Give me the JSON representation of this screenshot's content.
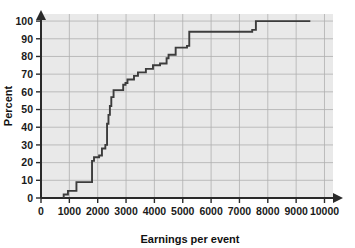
{
  "chart_data": {
    "type": "line",
    "subtype": "step-ecdf",
    "title": "",
    "xlabel": "Earnings per event",
    "ylabel": "Percent",
    "xlim": [
      0,
      10300
    ],
    "ylim": [
      0,
      104
    ],
    "grid": true,
    "legend": null,
    "xticks": [
      0,
      1000,
      2000,
      3000,
      4000,
      5000,
      6000,
      7000,
      8000,
      9000,
      10000
    ],
    "xticklabels": [
      "0",
      "1000",
      "2000",
      "3000",
      "4000",
      "5000",
      "6000",
      "7000",
      "8000",
      "9000",
      "10000"
    ],
    "yticks": [
      0,
      10,
      20,
      30,
      40,
      50,
      60,
      70,
      80,
      90,
      100
    ],
    "yticklabels": [
      "0",
      "10",
      "20",
      "30",
      "40",
      "50",
      "60",
      "70",
      "80",
      "90",
      "100"
    ],
    "x": [
      800,
      800,
      950,
      950,
      1250,
      1250,
      1800,
      1800,
      1870,
      1870,
      2050,
      2050,
      2150,
      2150,
      2270,
      2270,
      2330,
      2330,
      2380,
      2380,
      2430,
      2430,
      2480,
      2480,
      2560,
      2560,
      2900,
      2900,
      2980,
      2980,
      3050,
      3050,
      3280,
      3280,
      3420,
      3420,
      3700,
      3700,
      3950,
      3950,
      4200,
      4200,
      4430,
      4430,
      4500,
      4500,
      4750,
      4750,
      5150,
      5150,
      5230,
      5230,
      7450,
      7450,
      7580,
      7580,
      9500
    ],
    "y": [
      0,
      2,
      2,
      4,
      4,
      9,
      9,
      21,
      21,
      23,
      23,
      24,
      24,
      28,
      28,
      30,
      30,
      42,
      42,
      47,
      47,
      52,
      52,
      57,
      57,
      61,
      61,
      64,
      64,
      65,
      65,
      67,
      67,
      69,
      69,
      71,
      71,
      73,
      73,
      75,
      75,
      76,
      76,
      79,
      79,
      81,
      81,
      85,
      85,
      86,
      86,
      94,
      94,
      95,
      95,
      100,
      100
    ],
    "series": [
      {
        "name": "cumulative percent",
        "color": "#3c3c3c",
        "steps": [
          {
            "x": 800,
            "percent": 2
          },
          {
            "x": 950,
            "percent": 4
          },
          {
            "x": 1250,
            "percent": 9
          },
          {
            "x": 1800,
            "percent": 21
          },
          {
            "x": 1870,
            "percent": 23
          },
          {
            "x": 2050,
            "percent": 24
          },
          {
            "x": 2150,
            "percent": 28
          },
          {
            "x": 2270,
            "percent": 30
          },
          {
            "x": 2330,
            "percent": 42
          },
          {
            "x": 2380,
            "percent": 47
          },
          {
            "x": 2430,
            "percent": 52
          },
          {
            "x": 2480,
            "percent": 57
          },
          {
            "x": 2560,
            "percent": 61
          },
          {
            "x": 2900,
            "percent": 64
          },
          {
            "x": 2980,
            "percent": 65
          },
          {
            "x": 3050,
            "percent": 67
          },
          {
            "x": 3280,
            "percent": 69
          },
          {
            "x": 3420,
            "percent": 71
          },
          {
            "x": 3700,
            "percent": 73
          },
          {
            "x": 3950,
            "percent": 75
          },
          {
            "x": 4200,
            "percent": 76
          },
          {
            "x": 4430,
            "percent": 79
          },
          {
            "x": 4500,
            "percent": 81
          },
          {
            "x": 4750,
            "percent": 85
          },
          {
            "x": 5150,
            "percent": 86
          },
          {
            "x": 5230,
            "percent": 94
          },
          {
            "x": 7450,
            "percent": 95
          },
          {
            "x": 7580,
            "percent": 100
          },
          {
            "x": 9500,
            "percent": 100
          }
        ]
      }
    ],
    "colors": {
      "plot_background": "#e9e9e9",
      "gridline": "#b0b0b0",
      "axis": "#2a2a2a",
      "curve": "#3c3c3c",
      "text": "#111111",
      "page_background": "#ffffff"
    }
  }
}
